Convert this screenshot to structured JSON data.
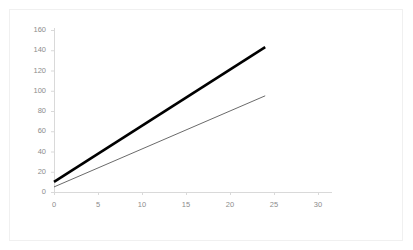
{
  "chart_data": {
    "type": "line",
    "title": "",
    "subtitle": "",
    "xlabel": "",
    "ylabel": "",
    "xlim": [
      0,
      30
    ],
    "ylim": [
      0,
      160
    ],
    "xticks": [
      0,
      5,
      10,
      15,
      20,
      25,
      30
    ],
    "yticks": [
      0,
      20,
      40,
      60,
      80,
      100,
      120,
      140,
      160
    ],
    "xtick_labels": [
      "0",
      "5",
      "10",
      "15",
      "20",
      "25",
      "30"
    ],
    "ytick_labels": [
      "0",
      "20",
      "40",
      "60",
      "80",
      "100",
      "120",
      "140",
      "160"
    ],
    "grid": false,
    "legend": "none",
    "background_color": "#ffffff",
    "axis_color": "#d9d9d9",
    "tick_label_color": "#8c8c8c",
    "series": [
      {
        "name": "series-1-thick",
        "color": "#000000",
        "line_width": 2.6,
        "x": [
          0,
          24
        ],
        "values": [
          10,
          143
        ]
      },
      {
        "name": "series-2-thin",
        "color": "#444444",
        "line_width": 0.8,
        "x": [
          0,
          24
        ],
        "values": [
          5,
          95
        ]
      }
    ]
  },
  "axes": {
    "y": {
      "labels": [
        "160",
        "140",
        "120",
        "100",
        "80",
        "60",
        "40",
        "20",
        "0"
      ]
    },
    "x": {
      "labels": [
        "0",
        "5",
        "10",
        "15",
        "20",
        "25",
        "30"
      ]
    }
  }
}
